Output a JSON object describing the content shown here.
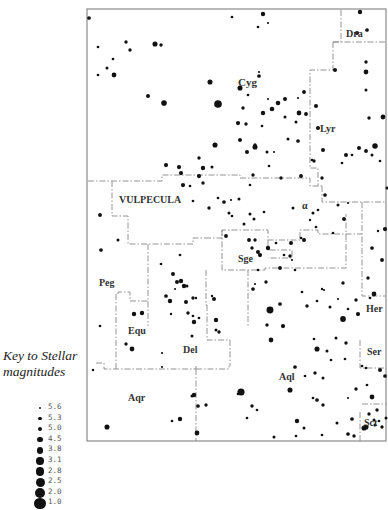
{
  "key": {
    "title_line1": "Key to Stellar",
    "title_line2": "magnitudes",
    "magnitudes": [
      {
        "label": "5.6",
        "r": 1.3
      },
      {
        "label": "5.3",
        "r": 1.7
      },
      {
        "label": "5.0",
        "r": 2.2
      },
      {
        "label": "4.5",
        "r": 2.7
      },
      {
        "label": "3.8",
        "r": 3.2
      },
      {
        "label": "3.1",
        "r": 3.7
      },
      {
        "label": "2.8",
        "r": 4.1
      },
      {
        "label": "2.5",
        "r": 4.5
      },
      {
        "label": "2.0",
        "r": 5.0
      },
      {
        "label": "1.0",
        "r": 5.6
      }
    ]
  },
  "map": {
    "frame": {
      "x": 87,
      "y": 9,
      "w": 299,
      "h": 432
    },
    "constellations": [
      {
        "name": "Dra",
        "x": 346,
        "y": 37,
        "size": 10
      },
      {
        "name": "Cyg",
        "x": 238,
        "y": 86,
        "size": 11
      },
      {
        "name": "Lyr",
        "x": 320,
        "y": 132,
        "size": 10
      },
      {
        "name": "VULPECULA",
        "x": 119,
        "y": 203,
        "size": 10
      },
      {
        "name": "Sge",
        "x": 238,
        "y": 262,
        "size": 10
      },
      {
        "name": "Her",
        "x": 366,
        "y": 312,
        "size": 10
      },
      {
        "name": "Peg",
        "x": 99,
        "y": 286,
        "size": 10
      },
      {
        "name": "Equ",
        "x": 128,
        "y": 334,
        "size": 10
      },
      {
        "name": "Del",
        "x": 183,
        "y": 353,
        "size": 10
      },
      {
        "name": "Aql",
        "x": 279,
        "y": 380,
        "size": 10
      },
      {
        "name": "Ser",
        "x": 367,
        "y": 355,
        "size": 10
      },
      {
        "name": "Aqr",
        "x": 128,
        "y": 401,
        "size": 10
      },
      {
        "name": "Sct",
        "x": 364,
        "y": 426,
        "size": 10
      },
      {
        "name": "α",
        "x": 302,
        "y": 209,
        "size": 10
      }
    ],
    "boundaries": [
      "M341,10 L341,42 L333,42",
      "M333,42 L386,42",
      "M333,42 L333,70 L310,70 L310,132 L310,168 L318,168 L318,186",
      "M88,181 L162,181 L162,175 L240,175 L240,178",
      "M240,178 L310,178 L310,186 L322,186",
      "M322,186 L322,202 L362,202 L386,202",
      "M112,181 L112,216 L128,216 L128,244 L193,244 L193,238 L205,238",
      "M205,238 L222,238 L222,230 L268,230 L268,240 L300,240 L300,230 L318,230 L318,234 L362,234",
      "M362,202 L362,296 L386,296",
      "M268,240 L268,250 L292,250 L292,258 L268,258",
      "M222,230 L222,270 L265,270 L265,268 L346,268 L346,240",
      "M346,240 L346,214",
      "M248,270 L248,327",
      "M206,270 L206,305 L207,305",
      "M148,244 L148,326",
      "M207,305 L207,340 L230,340",
      "M230,340 L230,366",
      "M118,294 L118,292 L130,292 L130,301 L148,301",
      "M116,294 L116,369",
      "M96,363 L104,363 L104,369 L196,369 L196,366",
      "M196,369 L229,369 L229,366",
      "M196,369 L196,441",
      "M360,340 L360,368 L386,368",
      "M362,404 L386,404",
      "M360,412 L360,441"
    ],
    "stars": [
      [
        89,
        18,
        2.2
      ],
      [
        155,
        44,
        3.0
      ],
      [
        161,
        45,
        2.0
      ],
      [
        126,
        42,
        2.0
      ],
      [
        130,
        50,
        2.0
      ],
      [
        98,
        47,
        1.6
      ],
      [
        113,
        59,
        1.6
      ],
      [
        98,
        75,
        1.6
      ],
      [
        107,
        68,
        1.8
      ],
      [
        114,
        75,
        2.8
      ],
      [
        148,
        96,
        2.4
      ],
      [
        164,
        103,
        3.3
      ],
      [
        210,
        82,
        3.0
      ],
      [
        218,
        104,
        4.5
      ],
      [
        240,
        88,
        3.0
      ],
      [
        259,
        76,
        2.2
      ],
      [
        259,
        72,
        1.3
      ],
      [
        304,
        92,
        2.3
      ],
      [
        298,
        98,
        1.3
      ],
      [
        248,
        95,
        1.6
      ],
      [
        268,
        99,
        1.3
      ],
      [
        272,
        109,
        2.7
      ],
      [
        263,
        113,
        2.6
      ],
      [
        238,
        123,
        2.5
      ],
      [
        215,
        145,
        3.0
      ],
      [
        240,
        140,
        2.4
      ],
      [
        246,
        124,
        2.0
      ],
      [
        243,
        108,
        2.0
      ],
      [
        278,
        103,
        2.7
      ],
      [
        285,
        99,
        2.4
      ],
      [
        285,
        117,
        1.8
      ],
      [
        299,
        113,
        2.8
      ],
      [
        306,
        114,
        2.3
      ],
      [
        316,
        106,
        2.4
      ],
      [
        318,
        128,
        2.4
      ],
      [
        335,
        70,
        2.4
      ],
      [
        360,
        12,
        2.6
      ],
      [
        357,
        33,
        2.4
      ],
      [
        367,
        30,
        2.2
      ],
      [
        366,
        62,
        2.0
      ],
      [
        366,
        72,
        2.8
      ],
      [
        366,
        90,
        1.8
      ],
      [
        369,
        118,
        2.0
      ],
      [
        383,
        117,
        2.8
      ],
      [
        359,
        148,
        2.4
      ],
      [
        346,
        155,
        2.4
      ],
      [
        342,
        163,
        1.6
      ],
      [
        352,
        155,
        1.6
      ],
      [
        372,
        155,
        1.8
      ],
      [
        380,
        161,
        1.6
      ],
      [
        375,
        146,
        3.2
      ],
      [
        366,
        151,
        2.3
      ],
      [
        323,
        150,
        2.4
      ],
      [
        314,
        161,
        2.0
      ],
      [
        322,
        178,
        2.0
      ],
      [
        288,
        139,
        1.8
      ],
      [
        296,
        122,
        1.8
      ],
      [
        298,
        141,
        2.2
      ],
      [
        262,
        126,
        1.6
      ],
      [
        267,
        152,
        1.8
      ],
      [
        274,
        152,
        1.3
      ],
      [
        247,
        152,
        2.4
      ],
      [
        255,
        147,
        3.0
      ],
      [
        199,
        158,
        2.0
      ],
      [
        199,
        176,
        2.5
      ],
      [
        212,
        167,
        1.8
      ],
      [
        269,
        166,
        1.6
      ],
      [
        281,
        178,
        2.0
      ],
      [
        301,
        176,
        2.3
      ],
      [
        312,
        160,
        1.6
      ],
      [
        325,
        195,
        2.2
      ],
      [
        344,
        219,
        2.3
      ],
      [
        338,
        205,
        1.8
      ],
      [
        348,
        203,
        1.3
      ],
      [
        387,
        188,
        1.8
      ],
      [
        385,
        229,
        2.5
      ],
      [
        372,
        248,
        2.2
      ],
      [
        378,
        231,
        1.4
      ],
      [
        382,
        260,
        2.3
      ],
      [
        368,
        278,
        2.0
      ],
      [
        374,
        294,
        2.8
      ],
      [
        370,
        298,
        1.6
      ],
      [
        356,
        300,
        2.0
      ],
      [
        358,
        314,
        2.5
      ],
      [
        343,
        319,
        3.4
      ],
      [
        343,
        283,
        2.0
      ],
      [
        338,
        299,
        1.3
      ],
      [
        330,
        307,
        1.8
      ],
      [
        348,
        309,
        1.6
      ],
      [
        322,
        289,
        1.4
      ],
      [
        255,
        145,
        2.0
      ],
      [
        100,
        215,
        2.3
      ],
      [
        101,
        250,
        2.2
      ],
      [
        118,
        240,
        1.8
      ],
      [
        166,
        165,
        2.5
      ],
      [
        179,
        167,
        2.5
      ],
      [
        181,
        173,
        2.5
      ],
      [
        183,
        185,
        2.5
      ],
      [
        190,
        186,
        1.6
      ],
      [
        203,
        168,
        2.6
      ],
      [
        203,
        183,
        2.0
      ],
      [
        193,
        201,
        1.6
      ],
      [
        209,
        208,
        2.0
      ],
      [
        218,
        198,
        1.6
      ],
      [
        232,
        216,
        1.6
      ],
      [
        231,
        200,
        1.3
      ],
      [
        229,
        213,
        1.8
      ],
      [
        226,
        236,
        2.3
      ],
      [
        224,
        202,
        2.2
      ],
      [
        253,
        175,
        2.0
      ],
      [
        250,
        185,
        1.6
      ],
      [
        239,
        199,
        1.8
      ],
      [
        250,
        214,
        1.8
      ],
      [
        254,
        219,
        1.8
      ],
      [
        244,
        224,
        1.8
      ],
      [
        264,
        212,
        1.6
      ],
      [
        249,
        240,
        2.3
      ],
      [
        252,
        248,
        2.0
      ],
      [
        258,
        252,
        2.4
      ],
      [
        268,
        248,
        2.6
      ],
      [
        276,
        243,
        1.6
      ],
      [
        291,
        243,
        2.4
      ],
      [
        290,
        256,
        2.0
      ],
      [
        284,
        255,
        1.6
      ],
      [
        292,
        260,
        1.3
      ],
      [
        258,
        270,
        1.6
      ],
      [
        255,
        240,
        2.0
      ],
      [
        260,
        255,
        2.5
      ],
      [
        280,
        268,
        2.3
      ],
      [
        295,
        270,
        1.6
      ],
      [
        304,
        240,
        2.4
      ],
      [
        310,
        220,
        1.4
      ],
      [
        313,
        213,
        1.8
      ],
      [
        293,
        208,
        1.8
      ],
      [
        301,
        238,
        1.6
      ],
      [
        318,
        210,
        1.6
      ],
      [
        333,
        233,
        1.6
      ],
      [
        316,
        227,
        1.6
      ],
      [
        180,
        255,
        1.6
      ],
      [
        173,
        274,
        2.4
      ],
      [
        177,
        282,
        2.4
      ],
      [
        181,
        281,
        2.6
      ],
      [
        184,
        286,
        2.6
      ],
      [
        187,
        286,
        1.8
      ],
      [
        193,
        298,
        2.0
      ],
      [
        188,
        313,
        2.0
      ],
      [
        186,
        302,
        2.4
      ],
      [
        193,
        316,
        1.6
      ],
      [
        199,
        318,
        1.6
      ],
      [
        194,
        322,
        2.6
      ],
      [
        192,
        336,
        1.8
      ],
      [
        196,
        298,
        1.4
      ],
      [
        214,
        299,
        2.4
      ],
      [
        216,
        320,
        2.6
      ],
      [
        219,
        332,
        2.0
      ],
      [
        212,
        296,
        1.4
      ],
      [
        216,
        330,
        1.8
      ],
      [
        161,
        264,
        1.6
      ],
      [
        175,
        289,
        1.3
      ],
      [
        166,
        296,
        2.2
      ],
      [
        170,
        301,
        2.6
      ],
      [
        171,
        314,
        1.4
      ],
      [
        100,
        326,
        1.6
      ],
      [
        126,
        344,
        2.0
      ],
      [
        134,
        314,
        2.6
      ],
      [
        142,
        313,
        2.6
      ],
      [
        132,
        349,
        2.8
      ],
      [
        162,
        353,
        1.3
      ],
      [
        162,
        367,
        1.3
      ],
      [
        192,
        396,
        1.8
      ],
      [
        194,
        395,
        2.6
      ],
      [
        198,
        406,
        2.2
      ],
      [
        206,
        405,
        2.0
      ],
      [
        197,
        433,
        2.8
      ],
      [
        172,
        421,
        1.6
      ],
      [
        180,
        419,
        2.6
      ],
      [
        107,
        427,
        3.0
      ],
      [
        93,
        370,
        1.5
      ],
      [
        253,
        289,
        2.2
      ],
      [
        255,
        284,
        1.3
      ],
      [
        266,
        282,
        2.0
      ],
      [
        280,
        304,
        2.2
      ],
      [
        270,
        310,
        4.1
      ],
      [
        267,
        325,
        2.0
      ],
      [
        271,
        340,
        2.8
      ],
      [
        283,
        326,
        2.5
      ],
      [
        295,
        367,
        2.2
      ],
      [
        302,
        292,
        1.6
      ],
      [
        307,
        306,
        2.0
      ],
      [
        324,
        290,
        1.3
      ],
      [
        317,
        301,
        1.6
      ],
      [
        314,
        339,
        1.6
      ],
      [
        317,
        349,
        3.0
      ],
      [
        336,
        338,
        1.8
      ],
      [
        346,
        343,
        2.0
      ],
      [
        327,
        351,
        1.8
      ],
      [
        345,
        359,
        1.6
      ],
      [
        331,
        360,
        1.6
      ],
      [
        315,
        373,
        2.0
      ],
      [
        323,
        378,
        1.8
      ],
      [
        305,
        376,
        1.6
      ],
      [
        290,
        390,
        3.0
      ],
      [
        313,
        398,
        1.6
      ],
      [
        317,
        400,
        2.2
      ],
      [
        323,
        405,
        2.0
      ],
      [
        356,
        389,
        2.0
      ],
      [
        241,
        392,
        4.2
      ],
      [
        238,
        394,
        1.6
      ],
      [
        252,
        406,
        2.0
      ],
      [
        247,
        418,
        1.6
      ],
      [
        257,
        410,
        1.6
      ],
      [
        297,
        421,
        2.6
      ],
      [
        304,
        428,
        1.8
      ],
      [
        322,
        435,
        1.6
      ],
      [
        337,
        423,
        1.8
      ],
      [
        348,
        398,
        1.3
      ],
      [
        352,
        419,
        2.2
      ],
      [
        369,
        414,
        2.0
      ],
      [
        374,
        420,
        1.8
      ],
      [
        375,
        425,
        1.8
      ],
      [
        377,
        410,
        2.0
      ],
      [
        366,
        427,
        3.0
      ],
      [
        364,
        428,
        3.0
      ],
      [
        382,
        427,
        2.0
      ],
      [
        386,
        418,
        1.8
      ],
      [
        348,
        434,
        2.2
      ],
      [
        354,
        436,
        2.0
      ],
      [
        296,
        436,
        1.6
      ],
      [
        274,
        437,
        1.8
      ],
      [
        362,
        366,
        1.6
      ],
      [
        380,
        370,
        2.4
      ],
      [
        366,
        368,
        1.6
      ],
      [
        385,
        376,
        2.2
      ],
      [
        367,
        385,
        1.6
      ],
      [
        372,
        397,
        2.8
      ],
      [
        379,
        421,
        1.6
      ],
      [
        232,
        17,
        1.6
      ],
      [
        263,
        14,
        2.6
      ],
      [
        258,
        27,
        1.6
      ],
      [
        268,
        23,
        1.3
      ]
    ]
  }
}
